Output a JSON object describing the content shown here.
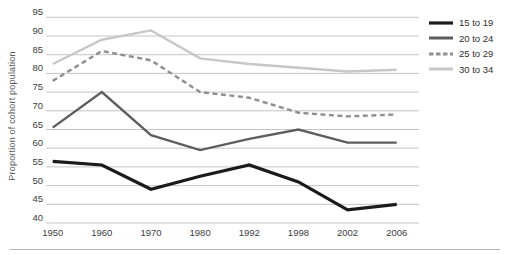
{
  "chart_data": {
    "type": "line",
    "title": "",
    "xlabel": "",
    "ylabel": "Proportion of cohort population",
    "categories": [
      "1950",
      "1960",
      "1970",
      "1980",
      "1992",
      "1998",
      "2002",
      "2006"
    ],
    "series": [
      {
        "name": "15 to 19",
        "color": "#1b1b1b",
        "width": 3.2,
        "dash": "",
        "values": [
          56.5,
          55.5,
          49,
          52.5,
          55.5,
          51,
          43.5,
          45
        ]
      },
      {
        "name": "20 to 24",
        "color": "#5e5e5e",
        "width": 2.4,
        "dash": "",
        "values": [
          65.5,
          75,
          63.5,
          59.5,
          62.5,
          65,
          61.5,
          61.5
        ]
      },
      {
        "name": "25 to 29",
        "color": "#8f8f8f",
        "width": 2.4,
        "dash": "5,3.5",
        "values": [
          78,
          86,
          83.5,
          75,
          73.5,
          69.5,
          68.5,
          69
        ]
      },
      {
        "name": "30 to 34",
        "color": "#c7c7c7",
        "width": 2.4,
        "dash": "",
        "values": [
          82.5,
          89,
          91.5,
          84,
          82.5,
          81.5,
          80.5,
          81
        ]
      }
    ],
    "ylim": [
      40,
      95
    ],
    "yticks": [
      95,
      90,
      85,
      80,
      75,
      70,
      65,
      60,
      55,
      50,
      45,
      40
    ],
    "grid": true,
    "legend_position": "top-right",
    "colors": {
      "gridline": "#c4c4c4",
      "tick_label": "#3d3d3d",
      "axis_title": "#5a5a5a",
      "separator": "#b3b3b3",
      "background": "#ffffff"
    }
  }
}
